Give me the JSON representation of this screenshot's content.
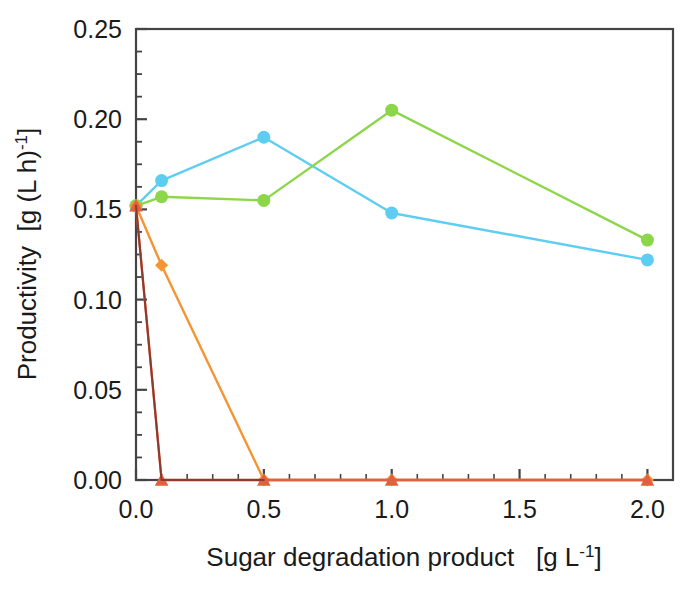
{
  "chart_data": {
    "type": "line",
    "title": "",
    "xlabel": "Sugar degradation product   [g L-1]",
    "xlabel_main": "Sugar degradation product",
    "xlabel_units_prefix": "[g L",
    "xlabel_units_exp": "-1",
    "xlabel_units_suffix": "]",
    "ylabel": "Productivity  [g (L h)-1]",
    "ylabel_main": "Productivity",
    "ylabel_units_prefix": "[g (L h)",
    "ylabel_units_exp": "-1",
    "ylabel_units_suffix": "]",
    "xlim": [
      0.0,
      2.1
    ],
    "ylim": [
      0.0,
      0.25
    ],
    "xticks": [
      0.0,
      0.5,
      1.0,
      1.5,
      2.0
    ],
    "xticklabels": [
      "0.0",
      "0.5",
      "1.0",
      "1.5",
      "2.0"
    ],
    "yticks": [
      0.0,
      0.05,
      0.1,
      0.15,
      0.2,
      0.25
    ],
    "yticklabels": [
      "0.00",
      "0.05",
      "0.10",
      "0.15",
      "0.20",
      "0.25"
    ],
    "x_minor_tick_step": 0.1,
    "y_minor_tick_step": 0.0125,
    "grid": false,
    "legend": "none",
    "frame": "box",
    "series": [
      {
        "name": "series-cyan",
        "color": "#5ecdf2",
        "marker": "circle",
        "marker_size": 13,
        "line_width": 2.4,
        "x": [
          0.0,
          0.1,
          0.5,
          1.0,
          2.0
        ],
        "values": [
          0.152,
          0.166,
          0.19,
          0.148,
          0.122
        ]
      },
      {
        "name": "series-green",
        "color": "#8cd64a",
        "marker": "circle",
        "marker_size": 13,
        "line_width": 2.4,
        "x": [
          0.0,
          0.1,
          0.5,
          1.0,
          2.0
        ],
        "values": [
          0.152,
          0.157,
          0.155,
          0.205,
          0.133
        ]
      },
      {
        "name": "series-orange",
        "color": "#f59433",
        "marker": "diamond",
        "marker_size": 13,
        "line_width": 2.4,
        "x": [
          0.0,
          0.1,
          0.5,
          1.0,
          2.0
        ],
        "values": [
          0.152,
          0.119,
          0.0,
          0.0,
          0.0
        ]
      },
      {
        "name": "series-red",
        "color": "#e0603f",
        "marker": "triangle",
        "marker_size": 13,
        "line_width": 2.4,
        "x": [
          0.0,
          0.1,
          0.5,
          1.0,
          2.0
        ],
        "values": [
          0.152,
          0.0,
          0.0,
          0.0,
          0.0
        ]
      },
      {
        "name": "series-darkred",
        "color": "#8c3a2e",
        "marker": "none",
        "marker_size": 0,
        "line_width": 2.0,
        "x": [
          0.0,
          0.1,
          0.5
        ],
        "values": [
          0.152,
          0.0,
          0.0
        ]
      }
    ],
    "axis_color": "#444444",
    "text_color": "#1a1a1a"
  },
  "geometry": {
    "plot_left": 136,
    "plot_right": 673,
    "plot_top": 29,
    "plot_bottom": 480
  }
}
